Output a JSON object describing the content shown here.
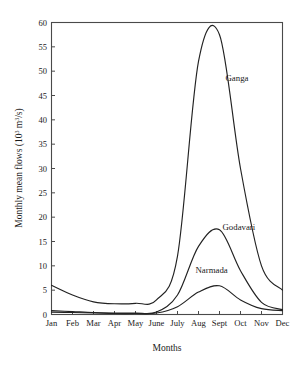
{
  "chart_data": {
    "type": "line",
    "title": "",
    "xlabel": "Months",
    "ylabel": "Monthly mean flows (10³ m³/s)",
    "ylabel_parts": {
      "main": "Monthly mean flows (10",
      "sup1": "3",
      "mid": " m",
      "sup2": "3",
      "tail": "/s)"
    },
    "categories": [
      "Jan",
      "Feb",
      "Mar",
      "Apr",
      "May",
      "June",
      "July",
      "Aug",
      "Sept",
      "Oct",
      "Nov",
      "Dec"
    ],
    "xlim": [
      0,
      11
    ],
    "ylim": [
      0,
      60
    ],
    "yticks": [
      0,
      5,
      10,
      15,
      20,
      25,
      30,
      35,
      40,
      45,
      50,
      55,
      60
    ],
    "ytick_labels": [
      "0",
      "5",
      "10",
      "15",
      "20",
      "25",
      "30",
      "35",
      "40",
      "45",
      "50",
      "55",
      "60"
    ],
    "grid": false,
    "legend_position": "inline-annotations",
    "series": [
      {
        "name": "Ganga",
        "label": "Ganga",
        "label_x_month": "Sept",
        "label_y_value": 48,
        "values": [
          6.0,
          4.0,
          2.6,
          2.2,
          2.3,
          3.0,
          12.0,
          52.0,
          57.5,
          30.0,
          10.0,
          5.0
        ]
      },
      {
        "name": "Godavari",
        "label": "Godavari",
        "label_x_month": "Sept",
        "label_y_value": 17.3,
        "values": [
          0.8,
          0.6,
          0.4,
          0.3,
          0.3,
          0.5,
          4.0,
          14.0,
          17.4,
          9.0,
          2.5,
          1.0
        ]
      },
      {
        "name": "Narmada",
        "label": "Narmada",
        "label_x_month": "Aug",
        "label_y_value": 8.6,
        "values": [
          0.5,
          0.4,
          0.3,
          0.2,
          0.2,
          0.3,
          1.6,
          4.6,
          5.9,
          3.0,
          1.2,
          0.8
        ]
      }
    ]
  },
  "colors": {
    "line": "#222222",
    "frame": "#4a4a4a",
    "background": "#ffffff",
    "text": "#1a1a1a"
  }
}
